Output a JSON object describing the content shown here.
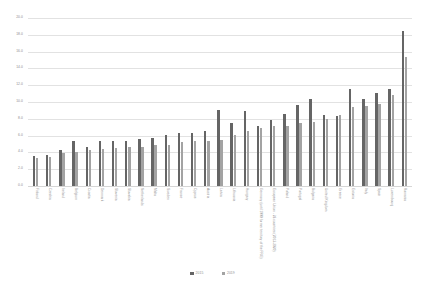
{
  "chart_data": {
    "type": "bar",
    "title": "",
    "xlabel": "",
    "ylabel": "",
    "ylim": [
      0.0,
      20.0
    ],
    "ytick_step": 2.0,
    "grid": true,
    "legend_position": "bottom",
    "yticks": [
      "20.0",
      "18.0",
      "16.0",
      "14.0",
      "12.0",
      "10.0",
      "8.0",
      "6.0",
      "4.0",
      "2.0",
      "0.0"
    ],
    "categories": [
      "Finland",
      "Czechia",
      "Ireland",
      "Belgium",
      "Croatia",
      "Denmark",
      "Slovenia",
      "Slovakia",
      "Netherlands",
      "Malta",
      "Sweden",
      "France",
      "Cyprus",
      "Austria",
      "Latvia",
      "Lithuania",
      "Hungary",
      "Germany (until 1990 former territory of the FRG)",
      "European Union - 28 countries (2013-2020)",
      "Poland",
      "Portugal",
      "Bulgaria",
      "United Kingdom",
      "Greece",
      "Estonia",
      "Italy",
      "Spain",
      "Luxembourg",
      "Romania"
    ],
    "series": [
      {
        "name": "2015",
        "color": "#656565",
        "values": [
          3.6,
          3.7,
          4.3,
          5.3,
          4.6,
          5.4,
          5.3,
          5.3,
          5.6,
          5.7,
          6.1,
          6.3,
          6.3,
          6.5,
          9.0,
          7.5,
          8.9,
          7.1,
          7.8,
          8.6,
          9.6,
          10.3,
          8.5,
          8.3,
          11.5,
          10.3,
          11.1,
          11.6,
          18.5
        ]
      },
      {
        "name": "2019",
        "color": "#a3a3a3",
        "values": [
          3.3,
          3.4,
          3.9,
          4.1,
          4.3,
          4.4,
          4.5,
          4.6,
          4.7,
          4.9,
          4.9,
          5.2,
          5.3,
          5.4,
          5.5,
          6.1,
          6.6,
          6.9,
          7.2,
          7.2,
          7.5,
          7.6,
          8.0,
          8.5,
          9.4,
          9.5,
          9.8,
          10.8,
          15.4
        ]
      }
    ]
  }
}
